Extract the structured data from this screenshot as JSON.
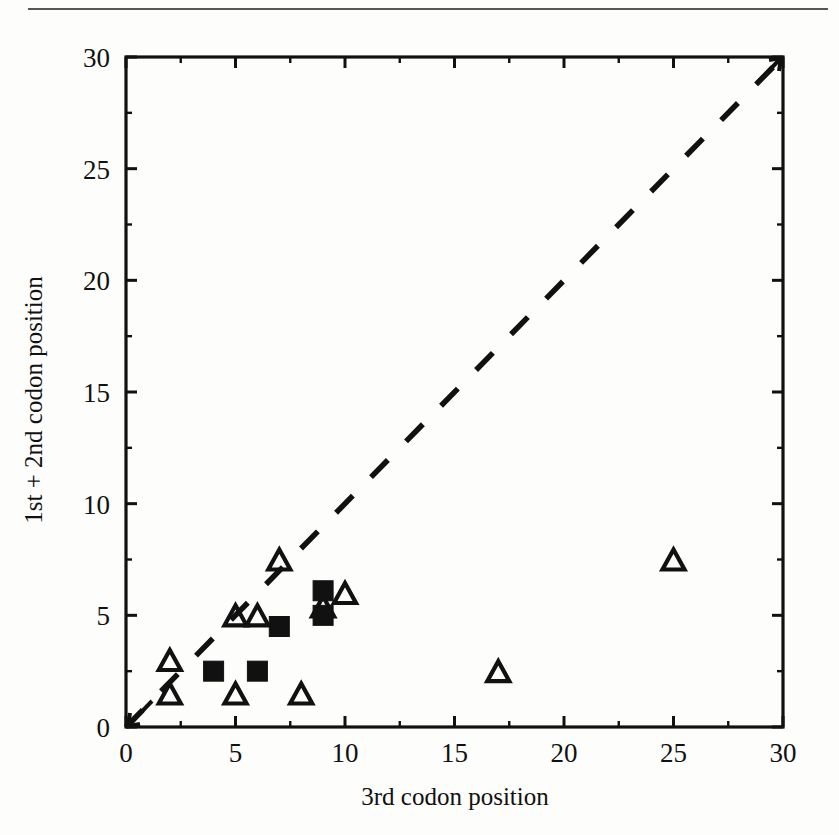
{
  "figure": {
    "background_color": "#fdfdfc",
    "ink_color": "#111111",
    "has_top_scan_rule": true
  },
  "chart_data": {
    "type": "scatter",
    "title": "",
    "xlabel": "3rd codon position",
    "ylabel": "1st + 2nd codon position",
    "xlim": [
      0,
      30
    ],
    "ylim": [
      0,
      30
    ],
    "xticks": [
      0,
      5,
      10,
      15,
      20,
      25,
      30
    ],
    "xtick_labels": [
      "0",
      "5",
      "10",
      "15",
      "20",
      "25",
      "30"
    ],
    "yticks": [
      0,
      5,
      10,
      15,
      20,
      25,
      30
    ],
    "ytick_labels": [
      "0",
      "5",
      "10",
      "15",
      "20",
      "25",
      "30"
    ],
    "minor_tick_interval": 2.5,
    "grid": false,
    "legend": null,
    "series": [
      {
        "name": "open-triangle",
        "marker": "triangle-open",
        "color": "#111111",
        "points": [
          {
            "x": 2,
            "y": 3.0
          },
          {
            "x": 2,
            "y": 1.5
          },
          {
            "x": 5,
            "y": 5.0
          },
          {
            "x": 5,
            "y": 1.5
          },
          {
            "x": 6,
            "y": 5.0
          },
          {
            "x": 7,
            "y": 7.5
          },
          {
            "x": 8,
            "y": 1.5
          },
          {
            "x": 9,
            "y": 5.4
          },
          {
            "x": 10,
            "y": 6.0
          },
          {
            "x": 17,
            "y": 2.5
          },
          {
            "x": 25,
            "y": 7.5
          }
        ]
      },
      {
        "name": "filled-square",
        "marker": "square-filled",
        "color": "#111111",
        "points": [
          {
            "x": 4,
            "y": 2.5
          },
          {
            "x": 6,
            "y": 2.5
          },
          {
            "x": 7,
            "y": 4.5
          },
          {
            "x": 9,
            "y": 6.1
          },
          {
            "x": 9,
            "y": 5.0
          }
        ]
      }
    ],
    "reference_line": {
      "name": "y-equals-x-diagonal",
      "style": "dashed",
      "from": {
        "x": 0,
        "y": 0
      },
      "to": {
        "x": 30,
        "y": 30
      },
      "color": "#111111"
    }
  }
}
